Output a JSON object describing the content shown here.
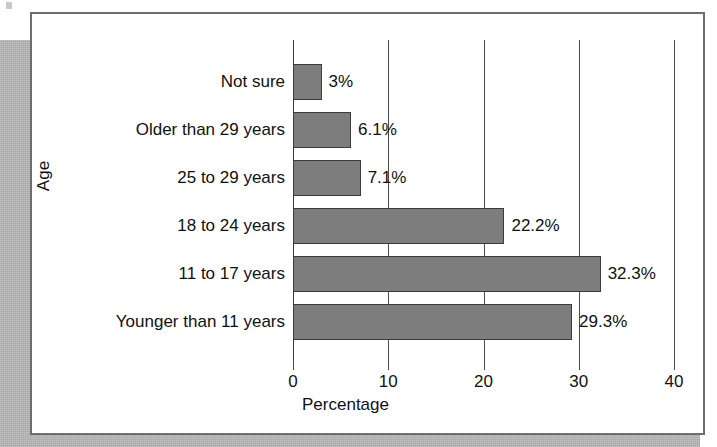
{
  "figure": {
    "card_border_color": "#6e6e6e",
    "shadow_color": "#a8a8a8",
    "bar_fill_color": "#7d7d7d",
    "bar_edge_color": "#3c3c3c",
    "gridline_color": "#4a4a4a",
    "text_color": "#111111"
  },
  "chart_data": {
    "type": "bar",
    "orientation": "horizontal",
    "title": "",
    "xlabel": "Percentage",
    "ylabel": "Age",
    "categories": [
      "Younger than 11 years",
      "11 to 17 years",
      "18 to 24 years",
      "25 to 29 years",
      "Older than 29 years",
      "Not sure"
    ],
    "values": [
      29.3,
      32.3,
      22.2,
      7.1,
      6.1,
      3.0
    ],
    "data_labels": [
      "29.3%",
      "32.3%",
      "22.2%",
      "7.1%",
      "6.1%",
      "3%"
    ],
    "xlim": [
      0,
      40
    ],
    "xticks": [
      0,
      10,
      20,
      30,
      40
    ],
    "xticklabels": [
      "0",
      "10",
      "20",
      "30",
      "40"
    ],
    "grid": true,
    "grid_axis": "x",
    "legend": false,
    "legend_position": "none"
  }
}
